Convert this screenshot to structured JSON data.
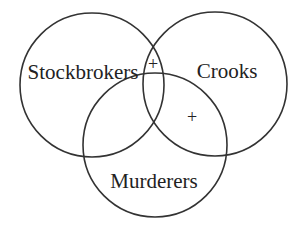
{
  "diagram": {
    "type": "venn",
    "sets": [
      {
        "label": "Stockbrokers",
        "cx": 92,
        "cy": 85,
        "r": 72
      },
      {
        "label": "Crooks",
        "cx": 215,
        "cy": 84,
        "r": 72
      },
      {
        "label": "Murderers",
        "cx": 155,
        "cy": 145,
        "r": 72
      }
    ],
    "markers": [
      {
        "symbol": "+",
        "region": "Stockbrokers ∩ Crooks (not Murderers)"
      },
      {
        "symbol": "+",
        "region": "Crooks ∩ Murderers (not Stockbrokers)"
      }
    ],
    "colors": {
      "stroke": "#333333",
      "text": "#222222",
      "background": "#ffffff"
    }
  }
}
